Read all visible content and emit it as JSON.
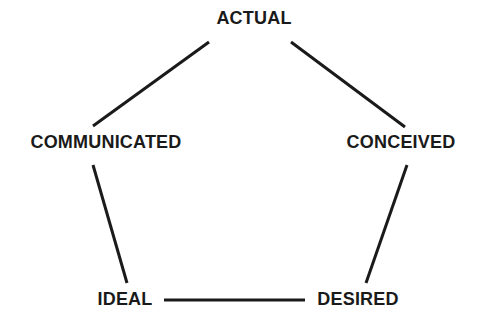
{
  "diagram": {
    "type": "pentagon-node-diagram",
    "background_color": "#ffffff",
    "line_color": "#1a1a1a",
    "line_width": 3,
    "text_color": "#1a1a1a",
    "nodes": [
      {
        "id": "actual",
        "label": "ACTUAL",
        "x": 254,
        "y": 18,
        "position": "top"
      },
      {
        "id": "communicated",
        "label": "COMMUNICATED",
        "x": 106,
        "y": 142,
        "position": "left"
      },
      {
        "id": "conceived",
        "label": "CONCEIVED",
        "x": 401,
        "y": 142,
        "position": "right"
      },
      {
        "id": "ideal",
        "label": "IDEAL",
        "x": 125,
        "y": 299,
        "position": "bottom-left"
      },
      {
        "id": "desired",
        "label": "DESIRED",
        "x": 358,
        "y": 299,
        "position": "bottom-right"
      }
    ],
    "edges": [
      {
        "id": "communicated-actual",
        "from": "communicated",
        "to": "actual",
        "x1": 93,
        "y1": 126,
        "x2": 209,
        "y2": 42
      },
      {
        "id": "actual-conceived",
        "from": "actual",
        "to": "conceived",
        "x1": 291,
        "y1": 42,
        "x2": 405,
        "y2": 127
      },
      {
        "id": "communicated-ideal",
        "from": "communicated",
        "to": "ideal",
        "x1": 93,
        "y1": 165,
        "x2": 127,
        "y2": 283
      },
      {
        "id": "conceived-desired",
        "from": "conceived",
        "to": "desired",
        "x1": 407,
        "y1": 165,
        "x2": 366,
        "y2": 283
      },
      {
        "id": "ideal-desired",
        "from": "ideal",
        "to": "desired",
        "x1": 164,
        "y1": 300,
        "x2": 305,
        "y2": 300
      }
    ]
  }
}
